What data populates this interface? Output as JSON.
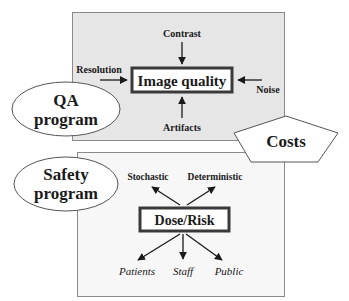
{
  "colors": {
    "panel_fill": "#e6e6e6",
    "panel_stroke": "#8a8a8a",
    "bottom_panel_fill": "#f7f7f7",
    "ink": "#1a1a1a",
    "shape_fill": "#ffffff"
  },
  "qa_section": {
    "program_label_line1": "QA",
    "program_label_line2": "program",
    "center_node": "Image quality",
    "factors": {
      "top": "Contrast",
      "left": "Resolution",
      "right": "Noise",
      "bottom": "Artifacts"
    }
  },
  "costs": {
    "label": "Costs"
  },
  "safety_section": {
    "program_label_line1": "Safety",
    "program_label_line2": "program",
    "center_node": "Dose/Risk",
    "effects": {
      "left": "Stochastic",
      "right": "Deterministic"
    },
    "groups": {
      "left": "Patients",
      "center": "Staff",
      "right": "Public"
    }
  }
}
